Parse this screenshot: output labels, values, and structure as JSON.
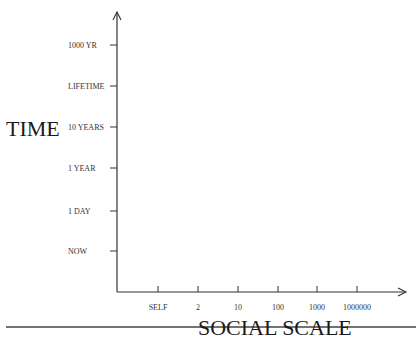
{
  "diagram": {
    "y_axis": {
      "title": "TIME",
      "ticks": [
        "1000 YR",
        "LIFETIME",
        "10 YEARS",
        "1 YEAR",
        "1 DAY",
        "NOW"
      ]
    },
    "x_axis": {
      "title": "SOCIAL SCALE",
      "ticks": [
        "SELF",
        "2",
        "10",
        "100",
        "1000",
        "1000000"
      ]
    }
  }
}
